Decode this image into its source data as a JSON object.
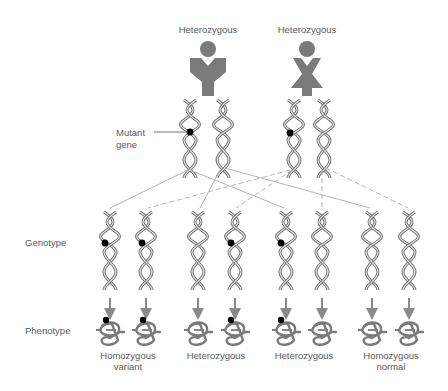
{
  "parents": [
    {
      "label": "Heterozygous",
      "sex": "male",
      "shape": "male-figure-icon"
    },
    {
      "label": "Heterozygous",
      "sex": "female",
      "shape": "female-figure-icon"
    }
  ],
  "annotations": {
    "mutant_gene": "Mutant\ngene",
    "mutant_gene_line1": "Mutant",
    "mutant_gene_line2": "gene"
  },
  "row_labels": {
    "genotype": "Genotype",
    "phenotype": "Phenotype"
  },
  "offspring_groups": [
    {
      "label_line1": "Homozygous",
      "label_line2": "variant",
      "count": 2,
      "mutant_alleles": 2
    },
    {
      "label_line1": "Heterozygous",
      "label_line2": "",
      "count": 2,
      "mutant_alleles": 1
    },
    {
      "label_line1": "Heterozygous",
      "label_line2": "",
      "count": 2,
      "mutant_alleles": 1
    },
    {
      "label_line1": "Homozygous",
      "label_line2": "normal",
      "count": 2,
      "mutant_alleles": 0
    }
  ],
  "offspring_chromosomes": [
    {
      "mutant": true
    },
    {
      "mutant": true
    },
    {
      "mutant": false
    },
    {
      "mutant": true
    },
    {
      "mutant": true
    },
    {
      "mutant": false
    },
    {
      "mutant": false
    },
    {
      "mutant": false
    }
  ],
  "colors": {
    "figure_fill": "#7a7a7a",
    "dna_stroke": "#7d7d7d",
    "line_color": "#b5b5b5",
    "arrow_color": "#8a8a8a",
    "mutant_dot": "#000000",
    "text": "#5a5a5a"
  }
}
